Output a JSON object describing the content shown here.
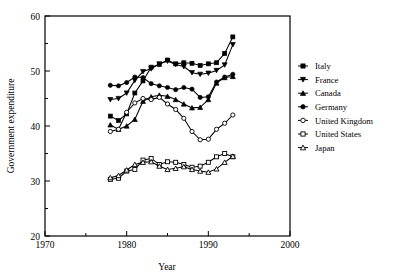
{
  "chart_data": {
    "type": "line",
    "title": "",
    "xlabel": "Year",
    "ylabel": "Government expenditure",
    "xlim": [
      1970,
      2000
    ],
    "ylim": [
      20,
      60
    ],
    "xticks": [
      1970,
      1980,
      1990,
      2000
    ],
    "xticklabels": [
      "1970",
      "1980",
      "1990",
      "2000"
    ],
    "xminorticks": [
      1975,
      1985,
      1995
    ],
    "yticks": [
      20,
      30,
      40,
      50,
      60
    ],
    "yticklabels": [
      "20",
      "30",
      "40",
      "50",
      "60"
    ],
    "yminorticks": [
      25,
      35,
      45,
      55
    ],
    "grid": false,
    "legend_position": "right",
    "series": [
      {
        "name": "Italy",
        "marker": "filled-square",
        "x": [
          1978,
          1979,
          1980,
          1981,
          1982,
          1983,
          1984,
          1985,
          1986,
          1987,
          1988,
          1989,
          1990,
          1991,
          1992,
          1993
        ],
        "y": [
          41.8,
          41.0,
          42.2,
          46.0,
          48.2,
          50.7,
          51.2,
          52.0,
          51.3,
          51.5,
          51.4,
          51.0,
          51.3,
          51.5,
          53.2,
          56.2
        ]
      },
      {
        "name": "France",
        "marker": "filled-down-triangle",
        "x": [
          1978,
          1979,
          1980,
          1981,
          1982,
          1983,
          1984,
          1985,
          1986,
          1987,
          1988,
          1989,
          1990,
          1991,
          1992,
          1993
        ],
        "y": [
          44.8,
          45.0,
          46.0,
          48.3,
          49.9,
          50.4,
          51.3,
          51.8,
          51.2,
          50.8,
          49.7,
          49.4,
          49.6,
          50.1,
          51.1,
          54.8
        ]
      },
      {
        "name": "Canada",
        "marker": "filled-up-triangle",
        "x": [
          1978,
          1979,
          1980,
          1981,
          1982,
          1983,
          1984,
          1985,
          1986,
          1987,
          1988,
          1989,
          1990,
          1991,
          1992,
          1993
        ],
        "y": [
          40.2,
          39.4,
          40.0,
          41.2,
          44.5,
          45.3,
          45.6,
          45.4,
          44.8,
          44.0,
          43.3,
          43.4,
          44.8,
          47.8,
          48.8,
          49.0
        ]
      },
      {
        "name": "Germany",
        "marker": "filled-circle",
        "x": [
          1978,
          1979,
          1980,
          1981,
          1982,
          1983,
          1984,
          1985,
          1986,
          1987,
          1988,
          1989,
          1990,
          1991,
          1992,
          1993
        ],
        "y": [
          47.4,
          47.3,
          47.9,
          48.9,
          48.8,
          47.7,
          47.3,
          47.0,
          46.6,
          47.0,
          46.7,
          45.2,
          45.3,
          48.0,
          48.9,
          49.4
        ]
      },
      {
        "name": "United Kingdom",
        "marker": "open-circle",
        "x": [
          1978,
          1979,
          1980,
          1981,
          1982,
          1983,
          1984,
          1985,
          1986,
          1987,
          1988,
          1989,
          1990,
          1991,
          1992,
          1993
        ],
        "y": [
          39.0,
          39.4,
          42.5,
          44.2,
          45.0,
          44.8,
          45.2,
          44.0,
          43.0,
          41.4,
          39.0,
          37.5,
          37.6,
          39.4,
          40.5,
          42.0
        ]
      },
      {
        "name": "United States",
        "marker": "open-square",
        "x": [
          1978,
          1979,
          1980,
          1981,
          1982,
          1983,
          1984,
          1985,
          1986,
          1987,
          1988,
          1989,
          1990,
          1991,
          1992,
          1993
        ],
        "y": [
          30.3,
          30.5,
          31.8,
          32.1,
          33.8,
          34.1,
          33.0,
          33.5,
          33.4,
          33.0,
          32.5,
          32.7,
          33.4,
          34.4,
          35.0,
          34.4
        ]
      },
      {
        "name": "Japan",
        "marker": "open-up-triangle",
        "x": [
          1978,
          1979,
          1980,
          1981,
          1982,
          1983,
          1984,
          1985,
          1986,
          1987,
          1988,
          1989,
          1990,
          1991,
          1992,
          1993
        ],
        "y": [
          30.6,
          31.0,
          32.0,
          33.0,
          33.4,
          33.5,
          32.7,
          32.1,
          32.3,
          32.6,
          32.1,
          31.8,
          31.6,
          32.2,
          33.4,
          34.5
        ]
      }
    ]
  },
  "legend": {
    "entries": [
      {
        "label": "Italy",
        "marker": "filled-square"
      },
      {
        "label": "France",
        "marker": "filled-down-triangle"
      },
      {
        "label": "Canada",
        "marker": "filled-up-triangle"
      },
      {
        "label": "Germany",
        "marker": "filled-circle"
      },
      {
        "label": "United Kingdom",
        "marker": "open-circle"
      },
      {
        "label": "United States",
        "marker": "open-square"
      },
      {
        "label": "Japan",
        "marker": "open-up-triangle"
      }
    ]
  },
  "colors": {
    "ink": "#000000",
    "paper": "#ffffff"
  }
}
